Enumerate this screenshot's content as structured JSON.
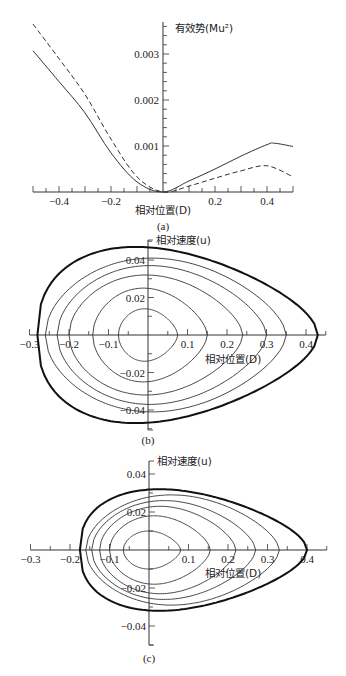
{
  "chart_data": [
    {
      "panel": "a",
      "type": "line",
      "caption": "(a)",
      "xlabel": "相对位置(D)",
      "ylabel": "有效势(Mu²)",
      "xlim": [
        -0.5,
        0.5
      ],
      "ylim": [
        0,
        0.0037
      ],
      "x_ticks": [
        "-0.4",
        "-0.2",
        "0.2",
        "0.4"
      ],
      "y_ticks": [
        "0.001",
        "0.002",
        "0.003"
      ],
      "grid": false,
      "series": [
        {
          "name": "solid",
          "style": "solid",
          "x": [
            -0.5,
            -0.4,
            -0.3,
            -0.2,
            -0.1,
            0.0,
            0.1,
            0.2,
            0.3,
            0.4,
            0.43,
            0.5
          ],
          "values": [
            0.00307,
            0.0024,
            0.00172,
            0.00085,
            0.00022,
            0.0,
            0.00024,
            0.0005,
            0.00078,
            0.00103,
            0.00106,
            0.00099
          ]
        },
        {
          "name": "dashed",
          "style": "dashed",
          "x": [
            -0.5,
            -0.4,
            -0.3,
            -0.2,
            -0.1,
            0.0,
            0.1,
            0.2,
            0.3,
            0.4,
            0.5
          ],
          "values": [
            0.00365,
            0.0029,
            0.00212,
            0.00115,
            0.00033,
            0.0,
            0.00013,
            0.0003,
            0.00046,
            0.00057,
            0.00033
          ]
        }
      ]
    },
    {
      "panel": "b",
      "type": "line",
      "caption": "(b)",
      "xlabel": "相对位置(D)",
      "ylabel": "相对速度(u)",
      "xlim": [
        -0.3,
        0.45
      ],
      "ylim": [
        -0.05,
        0.05
      ],
      "x_ticks": [
        "-0.3",
        "-0.2",
        "-0.1",
        "0.1",
        "0.2",
        "0.3",
        "0.4"
      ],
      "y_ticks": [
        "0.04",
        "0.02",
        "-0.02",
        "-0.04"
      ],
      "grid": false,
      "series": [
        {
          "name": "orbit-1",
          "D_min": -0.075,
          "D_max": 0.075,
          "u_max": 0.014
        },
        {
          "name": "orbit-2",
          "D_min": -0.14,
          "D_max": 0.15,
          "u_max": 0.025
        },
        {
          "name": "orbit-3",
          "D_min": -0.2,
          "D_max": 0.24,
          "u_max": 0.032
        },
        {
          "name": "orbit-4",
          "D_min": -0.23,
          "D_max": 0.3,
          "u_max": 0.037
        },
        {
          "name": "orbit-5",
          "D_min": -0.26,
          "D_max": 0.35,
          "u_max": 0.041
        },
        {
          "name": "separatrix",
          "style": "bold",
          "D_min": -0.28,
          "D_max": 0.43,
          "u_max": 0.047
        }
      ]
    },
    {
      "panel": "c",
      "type": "line",
      "caption": "(c)",
      "xlabel": "相对位置(D)",
      "ylabel": "相对速度(u)",
      "xlim": [
        -0.3,
        0.45
      ],
      "ylim": [
        -0.05,
        0.05
      ],
      "x_ticks": [
        "-0.3",
        "-0.2",
        "-0.1",
        "0.1",
        "0.2",
        "0.3",
        "0.4"
      ],
      "y_ticks": [
        "0.04",
        "0.02",
        "-0.02",
        "-0.04"
      ],
      "grid": false,
      "series": [
        {
          "name": "orbit-1",
          "D_min": -0.065,
          "D_max": 0.08,
          "u_max": 0.01
        },
        {
          "name": "orbit-2",
          "D_min": -0.1,
          "D_max": 0.155,
          "u_max": 0.018
        },
        {
          "name": "orbit-3",
          "D_min": -0.125,
          "D_max": 0.22,
          "u_max": 0.023
        },
        {
          "name": "orbit-4",
          "D_min": -0.145,
          "D_max": 0.27,
          "u_max": 0.026
        },
        {
          "name": "orbit-5",
          "D_min": -0.16,
          "D_max": 0.33,
          "u_max": 0.029
        },
        {
          "name": "separatrix",
          "style": "bold",
          "D_min": -0.175,
          "D_max": 0.4,
          "u_max": 0.032
        }
      ]
    }
  ]
}
